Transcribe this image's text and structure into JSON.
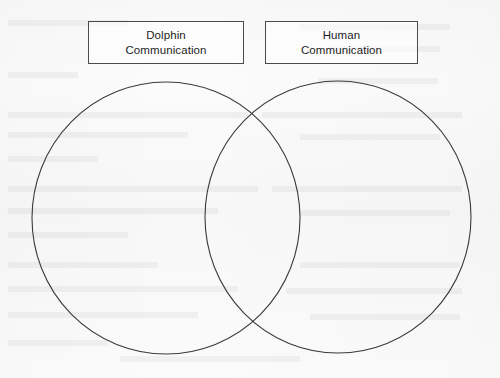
{
  "document": {
    "type": "venn-diagram-worksheet",
    "title": "Dolphin Communication vs Human Communication Venn Diagram",
    "background_color": "#fbfbfb",
    "stroke_color": "#3a3a3a",
    "text_color": "#1d1d1d",
    "width": 500,
    "height": 378
  },
  "labels": {
    "left": {
      "line1": "Dolphin",
      "line2": "Communication"
    },
    "right": {
      "line1": "Human",
      "line2": "Communication"
    }
  },
  "diagram_data": {
    "type": "venn",
    "sets": 2,
    "circles": [
      {
        "name": "Dolphin Communication",
        "cx": 166,
        "cy": 218,
        "rx": 134,
        "ry": 136,
        "fill": "none",
        "stroke": "#3a3a3a",
        "stroke_width": 1.1,
        "contents": []
      },
      {
        "name": "Human Communication",
        "cx": 338,
        "cy": 217,
        "rx": 133,
        "ry": 136,
        "fill": "none",
        "stroke": "#3a3a3a",
        "stroke_width": 1.1,
        "contents": []
      }
    ],
    "intersection": {
      "name": "Both",
      "contents": [],
      "upper_point": {
        "x": 255,
        "y": 113
      },
      "lower_point": {
        "x": 254,
        "y": 320
      }
    },
    "label_boxes": [
      {
        "for": "Dolphin Communication",
        "x": 88,
        "y": 21,
        "width": 156,
        "height": 43
      },
      {
        "for": "Human Communication",
        "x": 265,
        "y": 21,
        "width": 153,
        "height": 43
      }
    ],
    "filled_in": false
  },
  "bleed_through": {
    "description": "faint mirrored text showing through from the reverse side of the scanned page",
    "legible": false
  }
}
